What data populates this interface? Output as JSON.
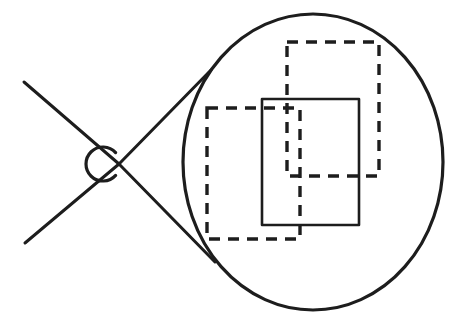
{
  "figure": {
    "canvas": {
      "width": 455,
      "height": 322
    },
    "colors": {
      "ink": "#1d1d1d",
      "background": "#ffffff"
    },
    "shapes": {
      "detail_ellipse": {
        "label": "magnified detail ellipse",
        "cx": 313,
        "cy": 162,
        "rx": 130,
        "ry": 148,
        "stroke_width": 3.2,
        "style": "solid"
      },
      "source_circle": {
        "label": "source region circle",
        "cx": 103,
        "cy": 164,
        "r": 17,
        "stroke_width": 3.2,
        "style": "solid-open-right",
        "gap_start_deg": -42,
        "gap_end_deg": 42
      },
      "crosshair_lines": [
        {
          "label": "upper-left diagonal line",
          "x1": 24,
          "y1": 82,
          "x2": 119,
          "y2": 164
        },
        {
          "label": "lower-left diagonal line",
          "x1": 25,
          "y1": 243,
          "x2": 119,
          "y2": 164
        }
      ],
      "callout_lines": [
        {
          "label": "upper tangent callout line",
          "x1": 119,
          "y1": 164,
          "x2": 211,
          "y2": 70
        },
        {
          "label": "lower tangent callout line",
          "x1": 119,
          "y1": 164,
          "x2": 215,
          "y2": 262
        }
      ],
      "rect_dashed_upper_right": {
        "label": "upper-right dashed rectangle",
        "x": 287,
        "y": 42,
        "width": 92,
        "height": 134,
        "stroke_width": 3.4,
        "dash": "11 8",
        "style": "dashed"
      },
      "rect_solid_center": {
        "label": "center solid rectangle",
        "x": 262,
        "y": 99,
        "width": 97,
        "height": 126,
        "stroke_width": 2.6,
        "style": "solid"
      },
      "rect_dashed_lower_left": {
        "label": "lower-left dashed rectangle",
        "x": 207,
        "y": 108,
        "width": 93,
        "height": 131,
        "stroke_width": 3.4,
        "dash": "11 8",
        "style": "dashed"
      }
    }
  }
}
